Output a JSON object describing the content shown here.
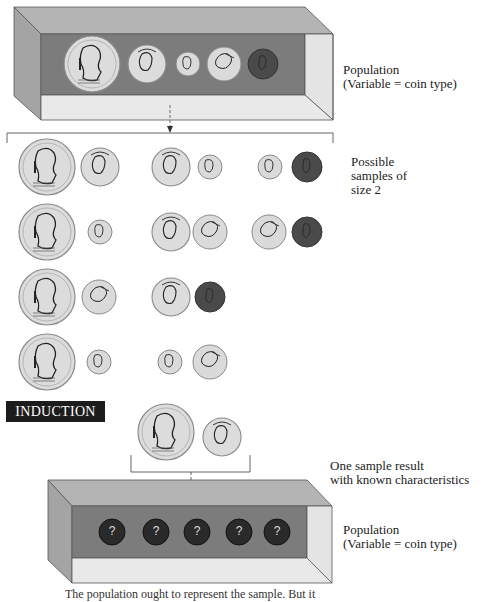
{
  "colors": {
    "box_top": "#b4b4b4",
    "box_left": "#a4a4a4",
    "box_back": "#7c7c7c",
    "box_right": "#e4e4e4",
    "box_bottom": "#e9e9e9",
    "coin_silver": "#d9d9d9",
    "coin_penny": "#4a4a4a",
    "unknown_coin": "#2a2a2a",
    "induction_bg": "#1c1c1c"
  },
  "top_population": {
    "label_line1": "Population",
    "label_line2": "(Variable = coin type)",
    "coins": [
      "half-dollar",
      "quarter",
      "dime",
      "nickel",
      "penny"
    ]
  },
  "samples": {
    "label_line1": "Possible",
    "label_line2": "samples of",
    "label_line3": "size 2",
    "pairs": [
      [
        "half-dollar",
        "quarter"
      ],
      [
        "quarter",
        "dime"
      ],
      [
        "dime",
        "penny"
      ],
      [
        "half-dollar",
        "dime"
      ],
      [
        "quarter",
        "nickel"
      ],
      [
        "nickel",
        "penny"
      ],
      [
        "half-dollar",
        "nickel"
      ],
      [
        "quarter",
        "penny"
      ],
      [
        "half-dollar",
        "dime"
      ],
      [
        "dime",
        "nickel"
      ]
    ]
  },
  "induction": {
    "label": "INDUCTION"
  },
  "sample_result": {
    "label_line1": "One sample result",
    "label_line2": "with known characteristics",
    "coins": [
      "half-dollar",
      "quarter"
    ]
  },
  "bottom_population": {
    "label_line1": "Population",
    "label_line2": "(Variable = coin type)",
    "unknown_coins": [
      "?",
      "?",
      "?",
      "?",
      "?"
    ]
  },
  "caption": "The population ought to represent the sample. But it"
}
